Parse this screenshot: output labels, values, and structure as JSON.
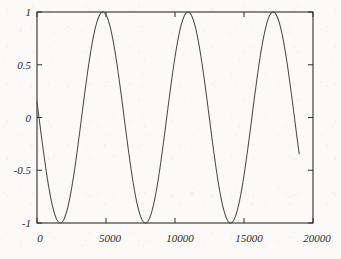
{
  "chart_data": {
    "type": "line",
    "title": "",
    "subtitle": "",
    "xlabel": "",
    "ylabel": "",
    "xlim": [
      0,
      20000
    ],
    "ylim": [
      -1,
      1
    ],
    "grid": false,
    "legend": null,
    "legend_position": "none",
    "x_ticks": [
      0,
      5000,
      10000,
      15000,
      20000
    ],
    "x_tick_labels": [
      "0",
      "5000",
      "10000",
      "15000",
      "20000"
    ],
    "y_ticks": [
      -1,
      -0.5,
      0,
      0.5,
      1
    ],
    "y_tick_labels": [
      "-1",
      "-0.5",
      "0",
      "0.5",
      "1"
    ],
    "line_color": "#4a4a4a",
    "axis_color": "#2e2e2e",
    "background_color": "#fbfaf8",
    "series": [
      {
        "name": "sine wave",
        "period": 6170,
        "amplitude": 1,
        "phase_shift": 3230,
        "x_start": 0,
        "x_end": 19000,
        "x": [
          0,
          250,
          500,
          750,
          1000,
          1250,
          1500,
          1750,
          2000,
          2250,
          2500,
          2750,
          3000,
          3250,
          3500,
          3750,
          4000,
          4250,
          4500,
          4750,
          5000,
          5250,
          5500,
          5750,
          6000,
          6250,
          6500,
          6750,
          7000,
          7250,
          7500,
          7750,
          8000,
          8250,
          8500,
          8750,
          9000,
          9250,
          9500,
          9750,
          10000,
          10250,
          10500,
          10750,
          11000,
          11250,
          11500,
          11750,
          12000,
          12250,
          12500,
          12750,
          13000,
          13250,
          13500,
          13750,
          14000,
          14250,
          14500,
          14750,
          15000,
          15250,
          15500,
          15750,
          16000,
          16250,
          16500,
          16750,
          17000,
          17250,
          17500,
          17750,
          18000,
          18250,
          18500,
          18750,
          19000
        ],
        "y": [
          -0.056,
          -0.303,
          -0.535,
          -0.737,
          -0.887,
          -0.976,
          -1.0,
          -0.955,
          -0.846,
          -0.68,
          -0.47,
          -0.231,
          0.02,
          0.269,
          0.5,
          0.704,
          0.862,
          0.962,
          1.0,
          0.97,
          0.873,
          0.717,
          0.514,
          0.279,
          0.028,
          -0.224,
          -0.459,
          -0.669,
          -0.835,
          -0.946,
          -0.998,
          -0.984,
          -0.903,
          -0.761,
          -0.569,
          -0.34,
          -0.095,
          0.154,
          0.395,
          0.61,
          0.787,
          0.916,
          0.991,
          1.0,
          0.947,
          0.839,
          0.673,
          0.461,
          0.22,
          -0.032,
          -0.28,
          -0.511,
          -0.713,
          -0.868,
          -0.965,
          -0.999,
          -0.968,
          -0.87,
          -0.713,
          -0.507,
          -0.271,
          -0.02,
          0.232,
          0.466,
          0.675,
          0.84,
          0.949,
          0.998,
          0.982,
          0.899,
          0.755,
          0.562,
          0.331,
          0.086,
          -0.163,
          -0.403,
          -0.617
        ]
      }
    ]
  },
  "plot_geometry": {
    "left": 37,
    "right": 313,
    "top": 12,
    "bottom": 223
  }
}
